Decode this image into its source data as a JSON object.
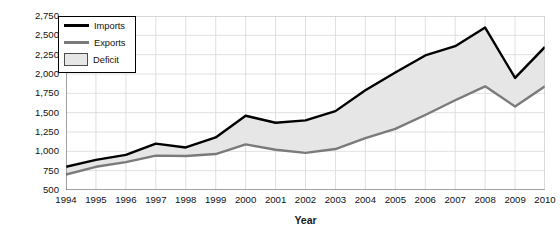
{
  "chart_data": {
    "type": "area",
    "title": "",
    "xlabel": "Year",
    "ylabel": "Billions of Dollars",
    "categories": [
      "1994",
      "1995",
      "1996",
      "1997",
      "1998",
      "1999",
      "2000",
      "2001",
      "2002",
      "2003",
      "2004",
      "2005",
      "2006",
      "2007",
      "2008",
      "2009",
      "2010"
    ],
    "x": [
      1994,
      1995,
      1996,
      1997,
      1998,
      1999,
      2000,
      2001,
      2002,
      2003,
      2004,
      2005,
      2006,
      2007,
      2008,
      2009,
      2010
    ],
    "series": [
      {
        "name": "Imports",
        "color": "#000000",
        "values": [
          800,
          890,
          955,
          1100,
          1050,
          1180,
          1460,
          1370,
          1400,
          1520,
          1790,
          2020,
          2240,
          2360,
          2600,
          1950,
          2350
        ]
      },
      {
        "name": "Exports",
        "color": "#7a7a7a",
        "values": [
          700,
          800,
          860,
          945,
          940,
          965,
          1090,
          1020,
          980,
          1030,
          1170,
          1290,
          1470,
          1660,
          1840,
          1580,
          1840
        ]
      }
    ],
    "fill": {
      "name": "Deficit",
      "color": "#e6e6e6",
      "description": "Shaded area between Imports and Exports"
    },
    "ylim": [
      500,
      2750
    ],
    "yticks": [
      "500",
      "750",
      "1,000",
      "1,250",
      "1,500",
      "1,750",
      "2,000",
      "2,250",
      "2,500",
      "2,750"
    ],
    "ytick_values": [
      500,
      750,
      1000,
      1250,
      1500,
      1750,
      2000,
      2250,
      2500,
      2750
    ],
    "xlim": [
      1994,
      2010
    ],
    "grid": true,
    "legend_position": "top-left",
    "legend_entries": [
      {
        "label": "Imports",
        "type": "line",
        "color": "#000000"
      },
      {
        "label": "Exports",
        "type": "line",
        "color": "#7a7a7a"
      },
      {
        "label": "Deficit",
        "type": "area",
        "color": "#e6e6e6"
      }
    ]
  }
}
